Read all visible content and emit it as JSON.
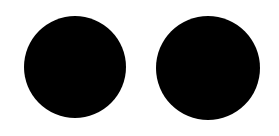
{
  "canvas": {
    "width": 279,
    "height": 136,
    "background": "#ffffff"
  },
  "shapes": [
    {
      "type": "circle",
      "cx": 75,
      "cy": 67,
      "r": 51,
      "fill": "#000000"
    },
    {
      "type": "circle",
      "cx": 208,
      "cy": 68,
      "r": 52,
      "fill": "#000000"
    }
  ]
}
